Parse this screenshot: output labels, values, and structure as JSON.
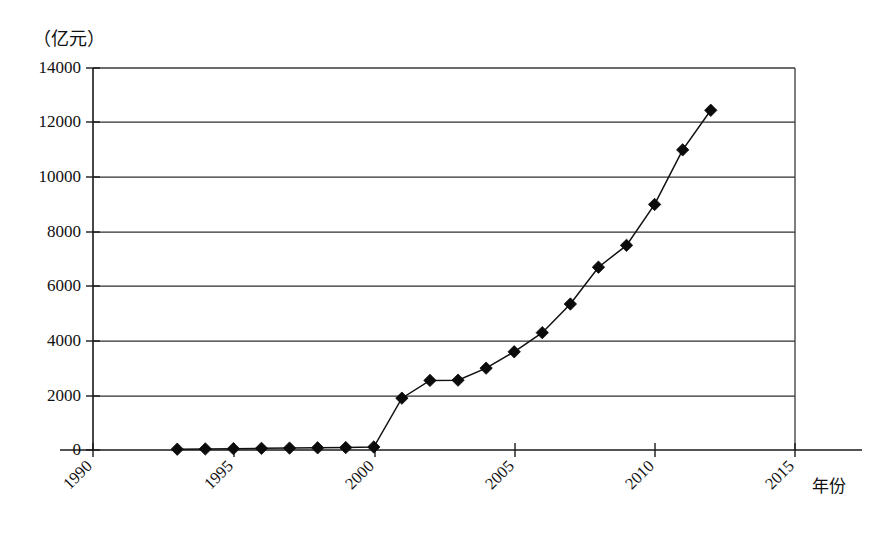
{
  "chart_data": {
    "type": "line",
    "title": "",
    "subtitle": "",
    "unit_label": "（亿元）",
    "xlabel": "年份",
    "ylabel": "",
    "ylim": [
      0,
      14000
    ],
    "xlim": [
      1990,
      2015
    ],
    "ytick_labels": [
      "0",
      "2000",
      "4000",
      "6000",
      "8000",
      "10000",
      "12000",
      "14000"
    ],
    "ytick_values": [
      0,
      2000,
      4000,
      6000,
      8000,
      10000,
      12000,
      14000
    ],
    "xtick_labels": [
      "1990",
      "1995",
      "2000",
      "2005",
      "2010",
      "2015"
    ],
    "xtick_values": [
      1990,
      1995,
      2000,
      2005,
      2010,
      2015
    ],
    "grid": "horizontal",
    "legend": "none",
    "marker": "diamond",
    "x": [
      1993,
      1994,
      1995,
      1996,
      1997,
      1998,
      1999,
      2000,
      2001,
      2002,
      2003,
      2004,
      2005,
      2006,
      2007,
      2008,
      2009,
      2010,
      2011,
      2012
    ],
    "values": [
      30,
      40,
      50,
      60,
      70,
      80,
      90,
      110,
      1900,
      2550,
      2560,
      3000,
      3600,
      4300,
      5350,
      6700,
      7500,
      9000,
      11000,
      12450
    ],
    "series": [
      {
        "name": "",
        "values": [
          30,
          40,
          50,
          60,
          70,
          80,
          90,
          110,
          1900,
          2550,
          2560,
          3000,
          3600,
          4300,
          5350,
          6700,
          7500,
          9000,
          11000,
          12450
        ]
      }
    ]
  },
  "figure": {
    "background_color": "#ffffff",
    "line_color": "#111111",
    "marker_color": "#0b0b0b",
    "grid_color": "#2e2e2e"
  }
}
